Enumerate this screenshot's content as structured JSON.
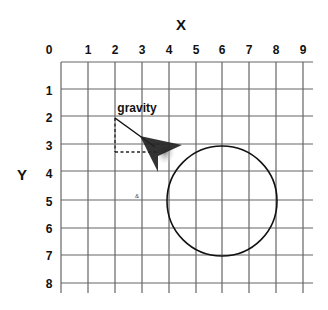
{
  "diagram": {
    "x_axis_title": "X",
    "y_axis_title": "Y",
    "x_ticks": [
      "0",
      "1",
      "2",
      "3",
      "4",
      "5",
      "6",
      "7",
      "8",
      "9"
    ],
    "y_ticks": [
      "1",
      "2",
      "3",
      "4",
      "5",
      "6",
      "7",
      "8"
    ],
    "vector_label": "gravity",
    "vector": {
      "from": [
        2,
        2
      ],
      "to": [
        3.4,
        3.2
      ]
    },
    "dashed_components": {
      "vertical_to": [
        2,
        3.25
      ],
      "horizontal_to": [
        3.4,
        3.25
      ]
    },
    "circle": {
      "center": [
        6,
        5
      ],
      "radius": 2
    },
    "colors": {
      "grid": "#555555",
      "ink": "#111111",
      "arrow": "#222222"
    }
  }
}
